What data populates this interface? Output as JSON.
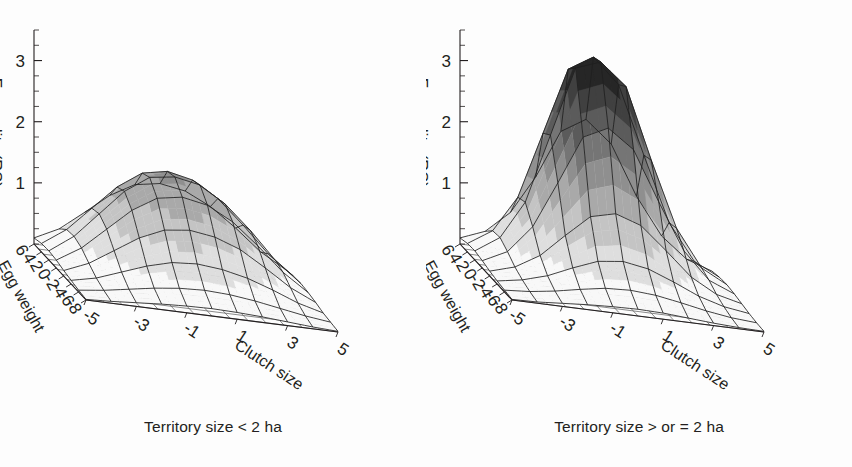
{
  "figure": {
    "background": "#fdfdfd",
    "ink": "#231f20",
    "panel_count": 2
  },
  "panels": [
    {
      "id": "left",
      "caption": "Territory size < 2 ha",
      "zaxis": {
        "label": "Fecundity (RS)",
        "ticks": [
          "3",
          "2",
          "1"
        ],
        "min": 0,
        "max": 3.5,
        "minor_step": 0.25
      },
      "xaxis": {
        "label": "Clutch size",
        "ticks": [
          "-5",
          "-3",
          "-1",
          "1",
          "3",
          "5"
        ],
        "min": -5,
        "max": 5
      },
      "yaxis": {
        "label": "Egg weight",
        "ticks": [
          "6",
          "4",
          "2",
          "0",
          "-2",
          "-4",
          "-6",
          "-8"
        ],
        "min": -8,
        "max": 6
      }
    },
    {
      "id": "right",
      "caption": "Territory size > or = 2 ha",
      "zaxis": {
        "label": "Fecundity (RS)",
        "ticks": [
          "3",
          "2",
          "1"
        ],
        "min": 0,
        "max": 3.5,
        "minor_step": 0.25
      },
      "xaxis": {
        "label": "Clutch size",
        "ticks": [
          "-5",
          "-3",
          "-1",
          "1",
          "3",
          "5"
        ],
        "min": -5,
        "max": 5
      },
      "yaxis": {
        "label": "Egg weight",
        "ticks": [
          "6",
          "4",
          "2",
          "0",
          "-2",
          "-4",
          "-6",
          "-8"
        ],
        "min": -8,
        "max": 6
      }
    }
  ],
  "chart_data": [
    {
      "type": "surface",
      "panel": "left",
      "title": "Territory size < 2 ha",
      "xlabel": "Clutch size",
      "ylabel": "Egg weight",
      "zlabel": "Fecundity (RS)",
      "xlim": [
        -5,
        5
      ],
      "ylim": [
        -8,
        6
      ],
      "zlim": [
        0,
        3.5
      ],
      "xticks": [
        -5,
        -3,
        -1,
        1,
        3,
        5
      ],
      "yticks": [
        6,
        4,
        2,
        0,
        -2,
        -4,
        -6,
        -8
      ],
      "zticks": [
        1,
        2,
        3
      ],
      "grid": true,
      "legend": "none",
      "shading": "grayscale-by-height",
      "peak_value": 1.6,
      "peak_at": {
        "x": -1.0,
        "y": 1.0
      },
      "description": "Broad low dome; fecundity rises to about 1.6 at intermediate clutch size and moderately positive egg weight, then falls off gradually toward all margins.",
      "x": [
        -5,
        -4,
        -3,
        -2,
        -1,
        0,
        1,
        2,
        3,
        4,
        5
      ],
      "y": [
        6,
        4,
        2,
        0,
        -2,
        -4,
        -6,
        -8
      ],
      "z": [
        [
          0.1,
          0.3,
          0.62,
          0.95,
          1.18,
          1.25,
          1.18,
          0.98,
          0.68,
          0.34,
          0.1
        ],
        [
          0.14,
          0.42,
          0.82,
          1.22,
          1.5,
          1.58,
          1.49,
          1.24,
          0.86,
          0.44,
          0.13
        ],
        [
          0.15,
          0.44,
          0.86,
          1.28,
          1.56,
          1.62,
          1.54,
          1.28,
          0.9,
          0.46,
          0.14
        ],
        [
          0.13,
          0.38,
          0.74,
          1.1,
          1.35,
          1.42,
          1.34,
          1.12,
          0.78,
          0.4,
          0.12
        ],
        [
          0.09,
          0.26,
          0.52,
          0.78,
          0.96,
          1.01,
          0.95,
          0.8,
          0.55,
          0.28,
          0.09
        ],
        [
          0.06,
          0.15,
          0.3,
          0.45,
          0.56,
          0.59,
          0.55,
          0.46,
          0.32,
          0.16,
          0.05
        ],
        [
          0.03,
          0.08,
          0.15,
          0.22,
          0.27,
          0.29,
          0.27,
          0.22,
          0.15,
          0.08,
          0.03
        ],
        [
          0.01,
          0.03,
          0.06,
          0.09,
          0.11,
          0.12,
          0.11,
          0.09,
          0.06,
          0.03,
          0.01
        ]
      ]
    },
    {
      "type": "surface",
      "panel": "right",
      "title": "Territory size > or = 2 ha",
      "xlabel": "Clutch size",
      "ylabel": "Egg weight",
      "zlabel": "Fecundity (RS)",
      "xlim": [
        -5,
        5
      ],
      "ylim": [
        -8,
        6
      ],
      "zlim": [
        0,
        3.5
      ],
      "xticks": [
        -5,
        -3,
        -1,
        1,
        3,
        5
      ],
      "yticks": [
        6,
        4,
        2,
        0,
        -2,
        -4,
        -6,
        -8
      ],
      "zticks": [
        1,
        2,
        3
      ],
      "grid": true,
      "legend": "none",
      "shading": "grayscale-by-height",
      "peak_value": 3.5,
      "peak_at": {
        "x": -1.0,
        "y": 2.0
      },
      "description": "Sharp tall peak rising to about 3.5 near intermediate clutch size and positive egg weight; surface is nearly flat and pale over most of the margins and climbs steeply only near the centre.",
      "x": [
        -5,
        -4,
        -3,
        -2,
        -1,
        0,
        1,
        2,
        3,
        4,
        5
      ],
      "y": [
        6,
        4,
        2,
        0,
        -2,
        -4,
        -6,
        -8
      ],
      "z": [
        [
          0.1,
          0.26,
          0.62,
          1.25,
          2.05,
          2.3,
          1.95,
          1.15,
          0.55,
          0.22,
          0.08
        ],
        [
          0.14,
          0.4,
          1.0,
          2.1,
          3.2,
          3.45,
          3.05,
          1.95,
          0.9,
          0.32,
          0.11
        ],
        [
          0.15,
          0.42,
          1.05,
          2.2,
          3.35,
          3.5,
          3.15,
          2.0,
          0.94,
          0.34,
          0.12
        ],
        [
          0.12,
          0.32,
          0.78,
          1.55,
          2.35,
          2.55,
          2.25,
          1.45,
          0.7,
          0.27,
          0.1
        ],
        [
          0.08,
          0.2,
          0.44,
          0.82,
          1.18,
          1.28,
          1.14,
          0.78,
          0.4,
          0.17,
          0.07
        ],
        [
          0.05,
          0.12,
          0.24,
          0.42,
          0.58,
          0.63,
          0.56,
          0.4,
          0.22,
          0.1,
          0.04
        ],
        [
          0.03,
          0.06,
          0.12,
          0.2,
          0.27,
          0.29,
          0.26,
          0.19,
          0.11,
          0.05,
          0.02
        ],
        [
          0.01,
          0.02,
          0.05,
          0.08,
          0.1,
          0.11,
          0.1,
          0.07,
          0.04,
          0.02,
          0.01
        ]
      ]
    }
  ]
}
